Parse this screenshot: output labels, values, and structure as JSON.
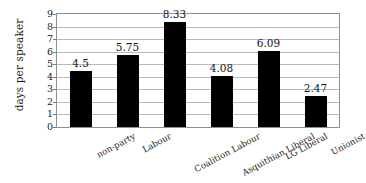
{
  "chart_data": {
    "type": "bar",
    "title": "",
    "xlabel": "",
    "ylabel": "days per speaker",
    "ylim": [
      0,
      9
    ],
    "yticks": [
      0,
      1,
      2,
      3,
      4,
      5,
      6,
      7,
      8,
      9
    ],
    "grid": true,
    "legend": false,
    "categories": [
      "non-party",
      "Labour",
      "Coalition Labour",
      "Asquithian Liberal",
      "LG Liberal",
      "Unionist"
    ],
    "values": [
      4.5,
      5.75,
      8.33,
      4.08,
      6.09,
      2.47
    ],
    "value_labels": [
      "4.5",
      "5.75",
      "8.33",
      "4.08",
      "6.09",
      "2.47"
    ],
    "bar_color": "#000000",
    "grid_color": "#b9b9b9",
    "frame_color": "#8f8f8f",
    "background": "#ffffff"
  }
}
